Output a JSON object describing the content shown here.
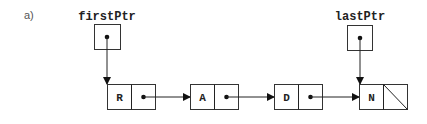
{
  "diagram": {
    "part_label": "a)",
    "pointers": [
      {
        "name": "firstPtr",
        "target_node": 0
      },
      {
        "name": "lastPtr",
        "target_node": 3
      }
    ],
    "nodes": [
      {
        "value": "R",
        "next": "pointer"
      },
      {
        "value": "A",
        "next": "pointer"
      },
      {
        "value": "D",
        "next": "pointer"
      },
      {
        "value": "N",
        "next": "null"
      }
    ],
    "colors": {
      "stroke": "#333333",
      "text": "#222222",
      "background": "#ffffff"
    }
  }
}
